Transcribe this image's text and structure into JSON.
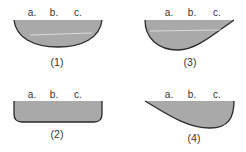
{
  "colors": {
    "fill": "#a9a9a9",
    "outline": "#2a2a2a",
    "text": "#333333",
    "highlight_line": "#e6e6e6"
  },
  "figures": [
    {
      "id": "1",
      "caption": "(1)",
      "shape": "semicircular-bowl",
      "labels": [
        "a.",
        "b.",
        "c."
      ],
      "has_inner_line": true
    },
    {
      "id": "2",
      "caption": "(2)",
      "shape": "rounded-rectangle-trough",
      "labels": [
        "a.",
        "b.",
        "c."
      ],
      "has_inner_line": false
    },
    {
      "id": "3",
      "caption": "(3)",
      "shape": "deep-left-shallow-right",
      "labels": [
        "a.",
        "b.",
        "c."
      ],
      "has_inner_line": true
    },
    {
      "id": "4",
      "caption": "(4)",
      "shape": "shallow-left-deep-right",
      "labels": [
        "a.",
        "b.",
        "c."
      ],
      "has_inner_line": false
    }
  ]
}
